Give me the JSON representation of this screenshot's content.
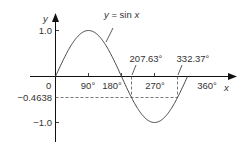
{
  "chart_data": {
    "type": "line",
    "title": "",
    "curve_label": "y = sin x",
    "xlabel": "x",
    "ylabel": "y",
    "x_ticks": [
      "90°",
      "180°",
      "270°",
      "360°"
    ],
    "x_tick_values": [
      90,
      180,
      270,
      360
    ],
    "y_ticks": [
      "1.0",
      "-1.0"
    ],
    "y_tick_values": [
      1.0,
      -1.0
    ],
    "origin_label": "0",
    "xlim": [
      0,
      360
    ],
    "ylim": [
      -1.0,
      1.0
    ],
    "grid": false,
    "series": [
      {
        "name": "y = sin x",
        "function": "sin",
        "x_start": 0,
        "x_end": 360,
        "step": 5
      }
    ],
    "annotations": [
      {
        "type": "hline_dashed",
        "y": -0.4638,
        "label": "−0.4638",
        "x_from": 0,
        "x_to": 332.37
      },
      {
        "type": "vline_dashed",
        "x": 207.63,
        "label": "207.63°",
        "y": -0.4638
      },
      {
        "type": "vline_dashed",
        "x": 332.37,
        "label": "332.37°",
        "y": -0.4638
      }
    ],
    "solutions": [
      207.63,
      332.37
    ],
    "equation": "sin x = -0.4638"
  },
  "labels": {
    "y_axis": "y",
    "x_axis": "x",
    "curve_prefix": "y = sin ",
    "curve_var": "x",
    "y_top": "1.0",
    "y_bottom": "−1.0",
    "y_neg_value": "−0.4638",
    "origin": "0",
    "tick_90": "90°",
    "tick_180": "180°",
    "tick_270": "270°",
    "tick_360": "360°",
    "sol1": "207.63°",
    "sol2": "332.37°"
  },
  "colors": {
    "axis": "#111111",
    "curve": "#444444",
    "text": "#333333",
    "dashed": "#555555"
  }
}
